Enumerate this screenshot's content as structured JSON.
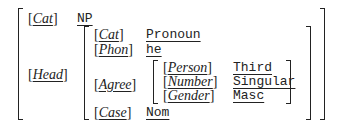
{
  "avm": {
    "cat": {
      "feature": "Cat",
      "value": "NP"
    },
    "head": {
      "feature": "Head",
      "cat": {
        "feature": "Cat",
        "value": "Pronoun"
      },
      "phon": {
        "feature": "Phon",
        "value": "he"
      },
      "agree": {
        "feature": "Agree",
        "person": {
          "feature": "Person",
          "value": "Third"
        },
        "number": {
          "feature": "Number",
          "value": "Singular"
        },
        "gender": {
          "feature": "Gender",
          "value": "Masc"
        }
      },
      "case": {
        "feature": "Case",
        "value": "Nom"
      }
    }
  }
}
